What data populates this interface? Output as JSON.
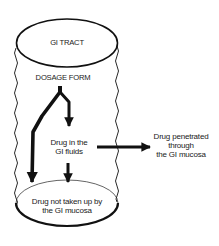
{
  "diagram": {
    "title": "GI TRACT",
    "nodes": {
      "gi_tract": {
        "label": "GI TRACT"
      },
      "dosage_form": {
        "label": "DOSAGE FORM"
      },
      "drug_in_fluids": {
        "line1": "Drug in the",
        "line2": "GI fluids"
      },
      "drug_penetrated": {
        "line1": "Drug penetrated",
        "line2": "through",
        "line3": "the GI mucosa"
      },
      "drug_not_taken_up": {
        "line1": "Drug not taken up by",
        "line2": "the GI mucosa"
      }
    },
    "edges": [
      {
        "from": "DOSAGE FORM",
        "to": "Drug in the GI fluids"
      },
      {
        "from": "DOSAGE FORM",
        "to": "Drug not taken up by the GI mucosa"
      },
      {
        "from": "Drug in the GI fluids",
        "to": "Drug penetrated through the GI mucosa"
      },
      {
        "from": "Drug in the GI fluids",
        "to": "Drug not taken up by the GI mucosa"
      }
    ],
    "colors": {
      "stroke": "#111111",
      "text": "#1a1a1a",
      "background": "#ffffff"
    }
  }
}
